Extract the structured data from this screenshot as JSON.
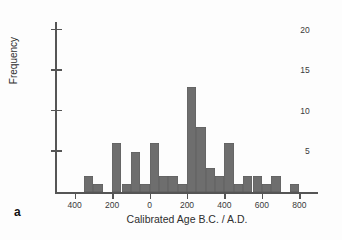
{
  "panel": {
    "label": "a"
  },
  "chart_data": {
    "type": "bar",
    "title": "",
    "subtitle": "",
    "xlabel": "Calibrated Age B.C. / A.D.",
    "ylabel": "Frequency",
    "grid": false,
    "legend": null,
    "annotations": [
      "a"
    ],
    "xtick_labels": [
      "400",
      "200",
      "0",
      "200",
      "400",
      "600",
      "800"
    ],
    "xtick_values": [
      -400,
      -200,
      0,
      200,
      400,
      600,
      800
    ],
    "ytick_labels": [
      "5",
      "10",
      "15",
      "20"
    ],
    "ytick_values": [
      5,
      10,
      15,
      20
    ],
    "xlim": [
      -500,
      900
    ],
    "ylim": [
      0,
      21
    ],
    "bin_width": 50,
    "bin_starts": [
      -350,
      -300,
      -200,
      -150,
      -100,
      -50,
      0,
      50,
      100,
      150,
      200,
      250,
      300,
      350,
      400,
      450,
      500,
      550,
      600,
      650,
      750
    ],
    "categories": [
      "-350",
      "-300",
      "-200",
      "-150",
      "-100",
      "-50",
      "0",
      "50",
      "100",
      "150",
      "200",
      "250",
      "300",
      "350",
      "400",
      "450",
      "500",
      "550",
      "600",
      "650",
      "750"
    ],
    "values": [
      2,
      1,
      6,
      1,
      5,
      1,
      6,
      2,
      2,
      1,
      13,
      8,
      3,
      2,
      6,
      1,
      2,
      2,
      1,
      2,
      1
    ]
  }
}
